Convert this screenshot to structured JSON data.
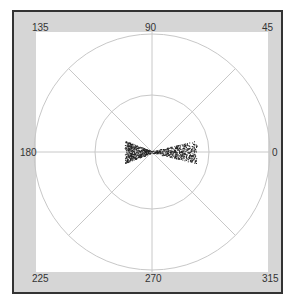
{
  "chart_data": {
    "type": "scatter",
    "subtype": "polar",
    "title": "",
    "angle_labels": [
      "0",
      "45",
      "90",
      "135",
      "180",
      "225",
      "270",
      "315"
    ],
    "angle_units": "degrees",
    "rings": 2,
    "grid": true,
    "spokes_deg": [
      0,
      45,
      90,
      135,
      180,
      225,
      270,
      315
    ],
    "extent": {
      "radial_fraction_of_inner_ring_along_0": 0.78,
      "radial_fraction_of_inner_ring_along_180": 0.48,
      "max_half_width_fraction_of_inner_ring": 0.18
    },
    "point_color": "#222222",
    "colors": {
      "frame": "#d6d6d6",
      "border": "#333333",
      "grid": "#c8c8c8",
      "background": "#ffffff"
    }
  },
  "labels": {
    "a0": "0",
    "a45": "45",
    "a90": "90",
    "a135": "135",
    "a180": "180",
    "a225": "225",
    "a270": "270",
    "a315": "315"
  }
}
